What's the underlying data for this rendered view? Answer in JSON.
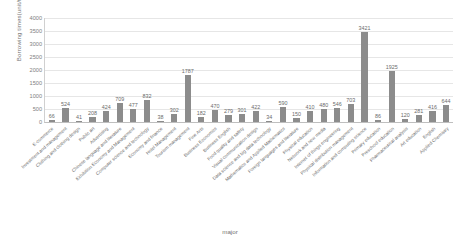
{
  "chart_data": {
    "type": "bar",
    "title": "",
    "xlabel": "major",
    "ylabel": "Borrowing times(unit/time)",
    "ylim": [
      0,
      4000
    ],
    "yticks": [
      4000,
      3500,
      3000,
      2500,
      2000,
      1500,
      1000,
      500,
      0
    ],
    "grid": true,
    "legend": false,
    "bar_color": "#8c8c8c",
    "categories": [
      "E-commerce",
      "Investment and management",
      "Clothing and clothing design",
      "Public art",
      "Advertising",
      "Chinese language and literature",
      "Exhibition Economy and Management",
      "Computer science and technology",
      "Economy and finance",
      "Hotel Management",
      "Tourism management",
      "Fine Arts",
      "Business Economics",
      "Business English",
      "Food quality and safety",
      "Visual communication design",
      "Data science and big data technology",
      "Mathematics and Applied Mathematics",
      "Foreign languages and literature",
      "Physical education",
      "Network and new media",
      "Internet of things engineering",
      "Physical distribution management",
      "Information and computing science",
      "Primary education",
      "Preschool education",
      "Pharmaceutical analysis",
      "Art education",
      "English",
      "Applied Chemistry"
    ],
    "values": [
      66,
      524,
      41,
      208,
      424,
      709,
      477,
      832,
      38,
      302,
      1787,
      182,
      470,
      279,
      301,
      422,
      34,
      590,
      150,
      410,
      480,
      546,
      703,
      3421,
      86,
      1925,
      120,
      281,
      416,
      644
    ]
  }
}
